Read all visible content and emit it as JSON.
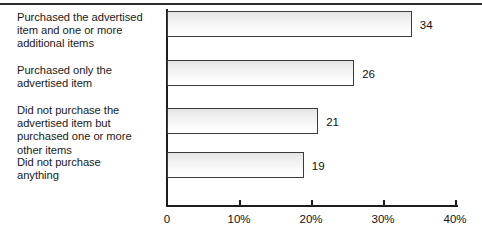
{
  "chart_data": {
    "type": "bar",
    "orientation": "horizontal",
    "title": "",
    "xlabel": "",
    "ylabel": "",
    "categories": [
      "Purchased the advertised item and one or more additional items",
      "Purchased only the advertised item",
      "Did not purchase the advertised item but purchased one or more other items",
      "Did not purchase anything"
    ],
    "category_lines": [
      "Purchased the advertised\nitem and one or more\nadditional items",
      "Purchased only the\nadvertised item",
      "Did not purchase the\nadvertised item but\npurchased one or more\nother items",
      "Did not purchase\nanything"
    ],
    "values": [
      34,
      26,
      21,
      19
    ],
    "value_labels": [
      "34",
      "26",
      "21",
      "19"
    ],
    "unit": "%",
    "xlim": [
      0,
      40
    ],
    "xticks": [
      0,
      10,
      20,
      30,
      40
    ],
    "xtick_labels": [
      "0",
      "10%",
      "20%",
      "30%",
      "40%"
    ],
    "grid": false,
    "legend": null,
    "colors": {
      "bar_fill_top": "#e4e4e4",
      "bar_fill_bottom": "#ffffff",
      "bar_outline": "#3a3a3a",
      "axis": "#1d1d1d",
      "text": "#111111",
      "top_rule": "#2b2b2b"
    }
  }
}
